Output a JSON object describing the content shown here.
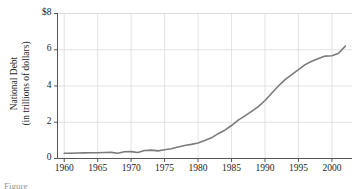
{
  "figure": {
    "background_color": "#ffffff",
    "caption_partial": "Figure"
  },
  "chart_data": {
    "type": "line",
    "title": "",
    "subtitle": "",
    "xlabel": "",
    "ylabel": "National Debt (in trillions of dollars)",
    "ylabel_line1": "National Debt",
    "ylabel_line2": "(in trillions of dollars)",
    "xlim": [
      1959,
      2003
    ],
    "ylim": [
      0,
      8
    ],
    "xticks": [
      1960,
      1965,
      1970,
      1975,
      1980,
      1985,
      1990,
      1995,
      2000
    ],
    "xtick_labels": [
      "1960",
      "1965",
      "1970",
      "1975",
      "1980",
      "1985",
      "1990",
      "1995",
      "2000"
    ],
    "yticks": [
      0,
      2,
      4,
      6,
      8
    ],
    "ytick_labels": [
      "0",
      "2",
      "4",
      "6",
      "$8"
    ],
    "grid": true,
    "grid_color": "#dcdcdc",
    "legend": null,
    "legend_position": "none",
    "line_color": "#7b7b7b",
    "line_width": 1.6,
    "series": [
      {
        "name": "National Debt",
        "x": [
          1960,
          1961,
          1962,
          1963,
          1964,
          1965,
          1966,
          1967,
          1968,
          1969,
          1970,
          1971,
          1972,
          1973,
          1974,
          1975,
          1976,
          1977,
          1978,
          1979,
          1980,
          1981,
          1982,
          1983,
          1984,
          1985,
          1986,
          1987,
          1988,
          1989,
          1990,
          1991,
          1992,
          1993,
          1994,
          1995,
          1996,
          1997,
          1998,
          1999,
          2000,
          2001,
          2002
        ],
        "values": [
          0.29,
          0.29,
          0.3,
          0.31,
          0.32,
          0.32,
          0.33,
          0.34,
          0.29,
          0.37,
          0.38,
          0.33,
          0.44,
          0.46,
          0.42,
          0.48,
          0.54,
          0.63,
          0.72,
          0.78,
          0.86,
          1.0,
          1.14,
          1.37,
          1.56,
          1.82,
          2.12,
          2.35,
          2.6,
          2.86,
          3.2,
          3.6,
          4.0,
          4.35,
          4.63,
          4.9,
          5.18,
          5.37,
          5.52,
          5.65,
          5.67,
          5.81,
          6.2
        ]
      }
    ]
  },
  "axes": {
    "left_spine_color": "#555555",
    "bottom_spine_color": "#555555"
  }
}
